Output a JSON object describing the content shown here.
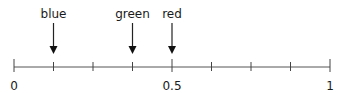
{
  "number_line": {
    "min": 0,
    "max": 1,
    "step": 0.125,
    "major_ticks": [
      0,
      0.5,
      1
    ],
    "tick_labels": [
      {
        "value": 0,
        "text": "0"
      },
      {
        "value": 0.5,
        "text": "0.5"
      },
      {
        "value": 1,
        "text": "1"
      }
    ]
  },
  "markers": [
    {
      "label": "blue",
      "value": 0.125
    },
    {
      "label": "green",
      "value": 0.375
    },
    {
      "label": "red",
      "value": 0.5
    }
  ]
}
